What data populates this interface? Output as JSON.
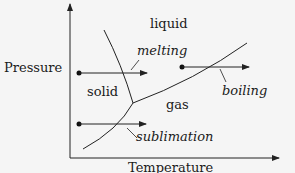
{
  "diagram": {
    "type": "phase-diagram",
    "axes": {
      "x_label": "Temperature",
      "y_label": "Pressure"
    },
    "regions": {
      "solid": "solid",
      "liquid": "liquid",
      "gas": "gas"
    },
    "transitions": {
      "melting": "melting",
      "boiling": "boiling",
      "sublimation": "sublimation"
    },
    "colors": {
      "line": "#222222",
      "background": "#f5f5f5"
    }
  }
}
